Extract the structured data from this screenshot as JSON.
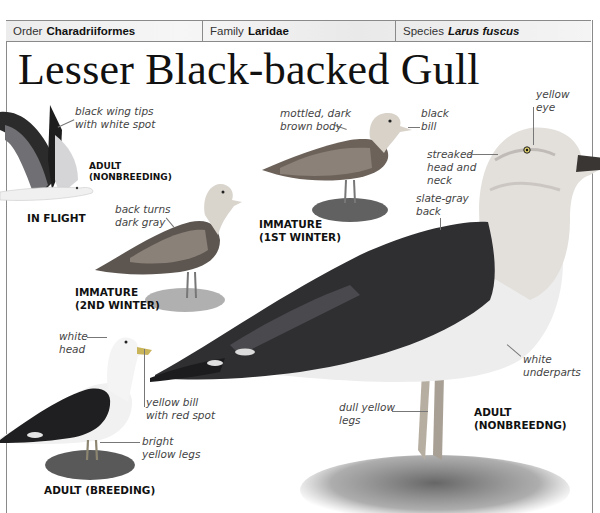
{
  "header": {
    "order": {
      "label": "Order",
      "value": "Charadriiformes"
    },
    "family": {
      "label": "Family",
      "value": "Laridae"
    },
    "species": {
      "label": "Species",
      "value": "Larus fuscus"
    }
  },
  "title": "Lesser Black-backed Gull",
  "figures": {
    "in_flight": {
      "caption": "IN FLIGHT",
      "sub_caption_line1": "ADULT",
      "sub_caption_line2": "(NONBREEDING)",
      "annotations": [
        {
          "line1": "black wing tips",
          "line2": "with white spot"
        }
      ]
    },
    "immature_2nd_winter": {
      "caption_line1": "IMMATURE",
      "caption_line2": "(2ND WINTER)",
      "annotations": [
        {
          "line1": "back turns",
          "line2": "dark gray"
        }
      ]
    },
    "immature_1st_winter": {
      "caption_line1": "IMMATURE",
      "caption_line2": "(1ST WINTER)",
      "annotations": [
        {
          "line1": "mottled, dark",
          "line2": "brown body"
        },
        {
          "line1": "black",
          "line2": "bill"
        }
      ]
    },
    "adult_breeding": {
      "caption": "ADULT (BREEDING)",
      "annotations": [
        {
          "line1": "white",
          "line2": "head"
        },
        {
          "line1": "yellow bill",
          "line2": "with red spot"
        },
        {
          "line1": "bright",
          "line2": "yellow legs"
        }
      ]
    },
    "adult_nonbreeding": {
      "caption_line1": "ADULT",
      "caption_line2": "(NONBREEDNG)",
      "annotations": [
        {
          "line1": "yellow",
          "line2": "eye"
        },
        {
          "line1": "streaked",
          "line2": "head and",
          "line3": "neck"
        },
        {
          "line1": "slate-gray",
          "line2": "back"
        },
        {
          "line1": "white",
          "line2": "underparts"
        },
        {
          "line1": "dull yellow",
          "line2": "legs"
        }
      ]
    }
  },
  "colors": {
    "header_bg": "#eeeeee",
    "rule": "#8a8a8a",
    "back_dark": "#2e2e30",
    "wing_gray": "#6d6d70",
    "body_white": "#f2f2f2"
  }
}
